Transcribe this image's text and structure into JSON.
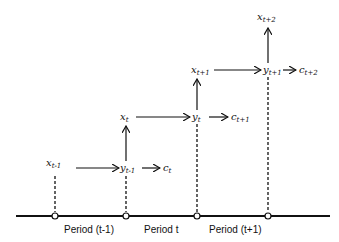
{
  "diagram": {
    "type": "timeline-flow",
    "nodes": [
      {
        "id": "x_t-1",
        "base": "x",
        "sub": "t-1"
      },
      {
        "id": "y_t-1",
        "base": "y",
        "sub": "t-1"
      },
      {
        "id": "c_t",
        "base": "c",
        "sub": "t"
      },
      {
        "id": "x_t",
        "base": "x",
        "sub": "t"
      },
      {
        "id": "y_t",
        "base": "y",
        "sub": "t"
      },
      {
        "id": "c_t+1",
        "base": "c",
        "sub": "t+1"
      },
      {
        "id": "x_t+1",
        "base": "x",
        "sub": "t+1"
      },
      {
        "id": "y_t+1",
        "base": "y",
        "sub": "t+1"
      },
      {
        "id": "c_t+2",
        "base": "c",
        "sub": "t+2"
      },
      {
        "id": "x_t+2",
        "base": "x",
        "sub": "t+2"
      }
    ],
    "edges": [
      [
        "x_t-1",
        "y_t-1"
      ],
      [
        "y_t-1",
        "c_t"
      ],
      [
        "y_t-1",
        "x_t"
      ],
      [
        "x_t",
        "y_t"
      ],
      [
        "y_t",
        "c_t+1"
      ],
      [
        "y_t",
        "x_t+1"
      ],
      [
        "x_t+1",
        "y_t+1"
      ],
      [
        "y_t+1",
        "c_t+2"
      ],
      [
        "y_t+1",
        "x_t+2"
      ]
    ],
    "periods": [
      {
        "label_pre": "Period (",
        "var": "t",
        "label_post": "-1)"
      },
      {
        "label_pre": "Period ",
        "var": "t",
        "label_post": ""
      },
      {
        "label_pre": "Period (",
        "var": "t",
        "label_post": "+1)"
      }
    ]
  },
  "labels": {
    "x_tm1": "x",
    "x_tm1_sub": "t-1",
    "y_tm1": "y",
    "y_tm1_sub": "t-1",
    "c_t": "c",
    "c_t_sub": "t",
    "x_t": "x",
    "x_t_sub": "t",
    "y_t": "y",
    "y_t_sub": "t",
    "c_tp1": "c",
    "c_tp1_sub": "t+1",
    "x_tp1": "x",
    "x_tp1_sub": "t+1",
    "y_tp1": "y",
    "y_tp1_sub": "t+1",
    "c_tp2": "c",
    "c_tp2_sub": "t+2",
    "x_tp2": "x",
    "x_tp2_sub": "t+2",
    "period1": "Period (t-1)",
    "period2": "Period t",
    "period3": "Period (t+1)"
  }
}
